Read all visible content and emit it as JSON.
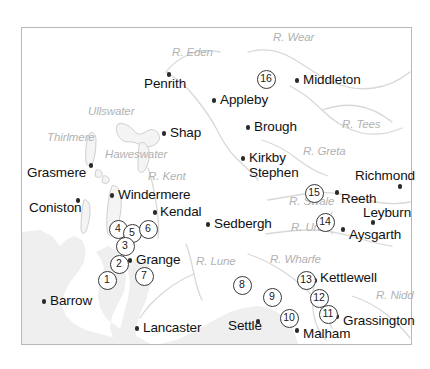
{
  "map": {
    "title": "Northern England locality map",
    "frame": {
      "x": 21,
      "y": 27,
      "width": 391,
      "height": 318,
      "border_color": "#b8b8b8"
    },
    "colors": {
      "background": "#ffffff",
      "land_fill": "#efefef",
      "river_line": "#d8d8d8",
      "lake_outline": "#cfcfcf",
      "town_dot": "#2a2a2a",
      "town_label": "#111111",
      "hydro_label": "#b2b2b2",
      "marker_ring": "#3a3a3a"
    },
    "towns": [
      {
        "name": "Penrith",
        "label_x": 144,
        "label_y": 88,
        "dot_x": 169,
        "dot_y": 78,
        "lines": 1
      },
      {
        "name": "Appleby",
        "label_x": 220,
        "label_y": 104,
        "dot_x": 214,
        "dot_y": 104,
        "lines": 1
      },
      {
        "name": "Middleton",
        "label_x": 303,
        "label_y": 84,
        "dot_x": 297,
        "dot_y": 84,
        "lines": 1
      },
      {
        "name": "Shap",
        "label_x": 170,
        "label_y": 137,
        "dot_x": 164,
        "dot_y": 137,
        "lines": 1
      },
      {
        "name": "Brough",
        "label_x": 254,
        "label_y": 131,
        "dot_x": 248,
        "dot_y": 131,
        "lines": 1
      },
      {
        "name": "Kirkby\nStephen",
        "label_x": 249,
        "label_y": 162,
        "dot_x": 243,
        "dot_y": 162,
        "lines": 2
      },
      {
        "name": "Grasmere",
        "label_x": 27,
        "label_y": 177,
        "dot_x": 91,
        "dot_y": 169,
        "lines": 1
      },
      {
        "name": "Richmond",
        "label_x": 355,
        "label_y": 180,
        "dot_x": 400,
        "dot_y": 190,
        "lines": 1
      },
      {
        "name": "Reeth",
        "label_x": 341,
        "label_y": 203,
        "dot_x": 337,
        "dot_y": 196,
        "lines": 1
      },
      {
        "name": "Coniston",
        "label_x": 29,
        "label_y": 212,
        "dot_x": 78,
        "dot_y": 204,
        "lines": 1
      },
      {
        "name": "Windermere",
        "label_x": 118,
        "label_y": 199,
        "dot_x": 112,
        "dot_y": 199,
        "lines": 1
      },
      {
        "name": "Kendal",
        "label_x": 160,
        "label_y": 216,
        "dot_x": 155,
        "dot_y": 216,
        "lines": 1
      },
      {
        "name": "Leyburn",
        "label_x": 363,
        "label_y": 217,
        "dot_x": 373,
        "dot_y": 226,
        "lines": 1
      },
      {
        "name": "Sedbergh",
        "label_x": 214,
        "label_y": 228,
        "dot_x": 208,
        "dot_y": 228,
        "lines": 1
      },
      {
        "name": "Aysgarth",
        "label_x": 349,
        "label_y": 239,
        "dot_x": 343,
        "dot_y": 233,
        "lines": 1
      },
      {
        "name": "Grange",
        "label_x": 136,
        "label_y": 264,
        "dot_x": 130,
        "dot_y": 264,
        "lines": 1
      },
      {
        "name": "Kettlewell",
        "label_x": 320,
        "label_y": 282,
        "dot_x": 315,
        "dot_y": 284,
        "lines": 1
      },
      {
        "name": "Barrow",
        "label_x": 50,
        "label_y": 305,
        "dot_x": 44,
        "dot_y": 305,
        "lines": 1
      },
      {
        "name": "Grassington",
        "label_x": 343,
        "label_y": 325,
        "dot_x": 337,
        "dot_y": 320,
        "lines": 1
      },
      {
        "name": "Lancaster",
        "label_x": 143,
        "label_y": 332,
        "dot_x": 137,
        "dot_y": 332,
        "lines": 1
      },
      {
        "name": "Settle",
        "label_x": 228,
        "label_y": 330,
        "dot_x": 258,
        "dot_y": 325,
        "lines": 1
      },
      {
        "name": "Malham",
        "label_x": 303,
        "label_y": 338,
        "dot_x": 297,
        "dot_y": 334,
        "lines": 1
      }
    ],
    "hydro_labels": [
      {
        "name": "R. Eden",
        "x": 172,
        "y": 56
      },
      {
        "name": "R. Wear",
        "x": 273,
        "y": 41
      },
      {
        "name": "Ullswater",
        "x": 88,
        "y": 115
      },
      {
        "name": "R. Tees",
        "x": 342,
        "y": 128
      },
      {
        "name": "Thirlmere",
        "x": 47,
        "y": 141
      },
      {
        "name": "Haweswater",
        "x": 105,
        "y": 158
      },
      {
        "name": "R. Greta",
        "x": 303,
        "y": 155
      },
      {
        "name": "R. Kent",
        "x": 148,
        "y": 180
      },
      {
        "name": "R. Swale",
        "x": 289,
        "y": 205
      },
      {
        "name": "R. Ure",
        "x": 291,
        "y": 231
      },
      {
        "name": "R. Lune",
        "x": 196,
        "y": 265
      },
      {
        "name": "R. Wharfe",
        "x": 270,
        "y": 263
      },
      {
        "name": "R. Nidd",
        "x": 376,
        "y": 299
      }
    ],
    "markers": [
      {
        "id": "16",
        "x": 265,
        "y": 78
      },
      {
        "id": "15",
        "x": 313,
        "y": 192
      },
      {
        "id": "14",
        "x": 324,
        "y": 221
      },
      {
        "id": "4",
        "x": 117,
        "y": 228
      },
      {
        "id": "5",
        "x": 131,
        "y": 232
      },
      {
        "id": "6",
        "x": 147,
        "y": 228
      },
      {
        "id": "3",
        "x": 124,
        "y": 245
      },
      {
        "id": "2",
        "x": 118,
        "y": 263
      },
      {
        "id": "7",
        "x": 143,
        "y": 275
      },
      {
        "id": "1",
        "x": 106,
        "y": 279
      },
      {
        "id": "8",
        "x": 241,
        "y": 284
      },
      {
        "id": "9",
        "x": 271,
        "y": 296
      },
      {
        "id": "13",
        "x": 305,
        "y": 279
      },
      {
        "id": "12",
        "x": 318,
        "y": 297
      },
      {
        "id": "11",
        "x": 327,
        "y": 313
      },
      {
        "id": "10",
        "x": 288,
        "y": 317
      }
    ]
  }
}
